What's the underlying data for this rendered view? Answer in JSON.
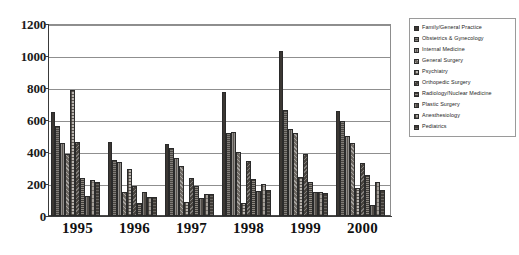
{
  "chart_data": {
    "type": "bar",
    "title": "",
    "xlabel": "",
    "ylabel": "",
    "ylim": [
      0,
      1200
    ],
    "ytick_step": 200,
    "ytick_labels": [
      "1200",
      "1000",
      "800",
      "600",
      "400",
      "200",
      "0"
    ],
    "grid": true,
    "legend_position": "right",
    "categories": [
      "1995",
      "1996",
      "1997",
      "1998",
      "1999",
      "2000"
    ],
    "series": [
      {
        "name": "Family/General Practice",
        "values": [
          650,
          462,
          450,
          775,
          1030,
          655
        ]
      },
      {
        "name": "Obstetrics & Gynecology",
        "values": [
          560,
          352,
          422,
          520,
          665,
          595
        ]
      },
      {
        "name": "Internal Medicine",
        "values": [
          455,
          340,
          365,
          525,
          545,
          500
        ]
      },
      {
        "name": "General Surgery",
        "values": [
          385,
          148,
          315,
          398,
          520,
          455
        ]
      },
      {
        "name": "Psychiatry",
        "values": [
          790,
          292,
          85,
          80,
          245,
          175
        ]
      },
      {
        "name": "Orthopedic Surgery",
        "values": [
          460,
          185,
          235,
          345,
          385,
          330
        ]
      },
      {
        "name": "Radiology/Nuclear Medicine",
        "values": [
          240,
          82,
          190,
          232,
          215,
          255
        ]
      },
      {
        "name": "Plastic Surgery",
        "values": [
          125,
          148,
          112,
          158,
          150,
          70
        ]
      },
      {
        "name": "Anesthesiology",
        "values": [
          225,
          118,
          140,
          200,
          152,
          215
        ]
      },
      {
        "name": "Pediatrics",
        "values": [
          210,
          118,
          135,
          165,
          142,
          160
        ]
      }
    ]
  },
  "legend": {
    "items": [
      {
        "label": "Family/General Practice"
      },
      {
        "label": "Obstetrics & Gynecology"
      },
      {
        "label": "Internal Medicine"
      },
      {
        "label": "General Surgery"
      },
      {
        "label": "Psychiatry"
      },
      {
        "label": "Orthopedic Surgery"
      },
      {
        "label": "Radiology/Nuclear Medicine"
      },
      {
        "label": "Plastic Surgery"
      },
      {
        "label": "Anesthesiology"
      },
      {
        "label": "Pediatrics"
      }
    ]
  }
}
